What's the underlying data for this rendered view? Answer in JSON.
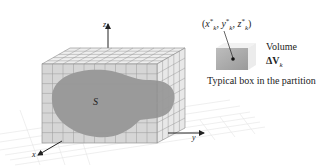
{
  "diagram": {
    "axes": {
      "x_label": "x",
      "y_label": "y",
      "z_label": "z"
    },
    "region_label": "S",
    "inset": {
      "point_label_prefix": "(",
      "point_x": "x",
      "point_y": "y",
      "point_z": "z",
      "star": "*",
      "subscript": "k",
      "volume_word": "Volume",
      "delta_v": "ΔV",
      "caption": "Typical box in the partition"
    },
    "colors": {
      "grid_line": "#9a9a9a",
      "box_face": "#d8d8d8",
      "region_fill": "#8c8c8c",
      "floor_grid": "#e2e2e2",
      "axis": "#222222"
    }
  }
}
